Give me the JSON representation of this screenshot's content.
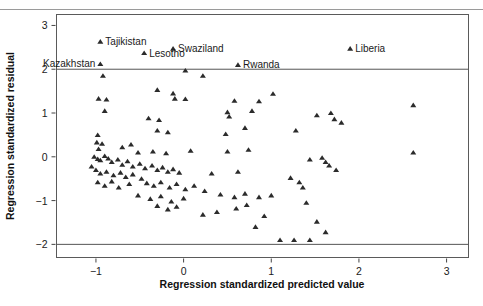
{
  "chart_data": {
    "type": "scatter",
    "title": "",
    "xlabel": "Regression standardized predicted value",
    "ylabel": "Regression standardized residual",
    "xlim": [
      -1.45,
      3.25
    ],
    "ylim": [
      -2.3,
      3.25
    ],
    "xticks": [
      -1,
      0,
      1,
      2,
      3
    ],
    "xticklabels": [
      "−1",
      "0",
      "1",
      "2",
      "3"
    ],
    "yticks": [
      -2,
      -1,
      0,
      1,
      2,
      3
    ],
    "yticklabels": [
      "−2",
      "−1",
      "0",
      "1",
      "2",
      "3"
    ],
    "grid": false,
    "legend": null,
    "reference_lines": [
      {
        "axis": "y",
        "value": 2
      },
      {
        "axis": "y",
        "value": -2
      }
    ],
    "marker": "triangle",
    "marker_color": "#2b2b2b",
    "annotations": [
      {
        "label": "Tajikistan",
        "x": -0.95,
        "y": 2.63,
        "anchor": "left"
      },
      {
        "label": "Kazakhstan",
        "x": -0.95,
        "y": 2.12,
        "anchor": "right"
      },
      {
        "label": "Lesotho",
        "x": -0.45,
        "y": 2.37,
        "anchor": "left"
      },
      {
        "label": "Swaziland",
        "x": -0.12,
        "y": 2.47,
        "anchor": "left"
      },
      {
        "label": "Rwanda",
        "x": 0.62,
        "y": 2.1,
        "anchor": "left"
      },
      {
        "label": "Liberia",
        "x": 1.9,
        "y": 2.47,
        "anchor": "left"
      }
    ],
    "points": [
      [
        -0.95,
        2.63
      ],
      [
        -0.95,
        2.12
      ],
      [
        -0.45,
        2.37
      ],
      [
        -0.12,
        2.47
      ],
      [
        0.62,
        2.1
      ],
      [
        1.9,
        2.47
      ],
      [
        -0.92,
        1.85
      ],
      [
        0.02,
        1.97
      ],
      [
        0.22,
        1.85
      ],
      [
        -0.3,
        1.53
      ],
      [
        -0.12,
        1.45
      ],
      [
        -0.1,
        1.33
      ],
      [
        0.02,
        1.32
      ],
      [
        0.58,
        1.28
      ],
      [
        0.86,
        1.27
      ],
      [
        1.02,
        1.44
      ],
      [
        -0.97,
        1.33
      ],
      [
        -0.88,
        1.31
      ],
      [
        2.62,
        1.18
      ],
      [
        -0.9,
        1.05
      ],
      [
        0.5,
        1.02
      ],
      [
        0.52,
        0.92
      ],
      [
        0.78,
        1.05
      ],
      [
        1.52,
        0.95
      ],
      [
        1.68,
        1.0
      ],
      [
        1.72,
        0.86
      ],
      [
        1.8,
        0.78
      ],
      [
        -0.4,
        0.88
      ],
      [
        -0.28,
        0.84
      ],
      [
        -0.98,
        0.5
      ],
      [
        -0.3,
        0.6
      ],
      [
        -0.18,
        0.56
      ],
      [
        0.48,
        0.52
      ],
      [
        0.7,
        0.66
      ],
      [
        1.28,
        0.6
      ],
      [
        -0.99,
        0.33
      ],
      [
        -0.93,
        0.3
      ],
      [
        -0.97,
        0.18
      ],
      [
        -0.7,
        0.22
      ],
      [
        -0.6,
        0.28
      ],
      [
        -0.52,
        0.1
      ],
      [
        -0.35,
        0.12
      ],
      [
        -0.2,
        0.08
      ],
      [
        0.08,
        0.14
      ],
      [
        0.5,
        0.12
      ],
      [
        0.74,
        0.16
      ],
      [
        2.62,
        0.1
      ],
      [
        -1.02,
        0.0
      ],
      [
        -0.98,
        -0.05
      ],
      [
        -0.95,
        -0.08
      ],
      [
        -0.9,
        0.02
      ],
      [
        -0.86,
        -0.04
      ],
      [
        -0.82,
        -0.12
      ],
      [
        -0.75,
        -0.06
      ],
      [
        -0.7,
        -0.18
      ],
      [
        -0.64,
        -0.1
      ],
      [
        -0.58,
        -0.22
      ],
      [
        -0.5,
        -0.16
      ],
      [
        -0.44,
        -0.26
      ],
      [
        -0.36,
        -0.2
      ],
      [
        -0.3,
        -0.3
      ],
      [
        -0.24,
        -0.24
      ],
      [
        -0.18,
        -0.34
      ],
      [
        -0.12,
        -0.28
      ],
      [
        -0.05,
        -0.36
      ],
      [
        -1.05,
        -0.22
      ],
      [
        -1.0,
        -0.3
      ],
      [
        -0.95,
        -0.38
      ],
      [
        -0.88,
        -0.34
      ],
      [
        -0.8,
        -0.42
      ],
      [
        -0.72,
        -0.36
      ],
      [
        -0.66,
        -0.46
      ],
      [
        -0.58,
        -0.4
      ],
      [
        -0.48,
        -0.5
      ],
      [
        1.44,
        -0.06
      ],
      [
        1.58,
        -0.02
      ],
      [
        1.62,
        -0.12
      ],
      [
        1.66,
        -0.2
      ],
      [
        1.74,
        -0.3
      ],
      [
        0.32,
        -0.38
      ],
      [
        0.62,
        -0.34
      ],
      [
        -0.42,
        -0.6
      ],
      [
        -0.34,
        -0.66
      ],
      [
        -0.26,
        -0.58
      ],
      [
        -0.16,
        -0.7
      ],
      [
        -0.08,
        -0.62
      ],
      [
        0.02,
        -0.74
      ],
      [
        0.12,
        -0.66
      ],
      [
        0.24,
        -0.78
      ],
      [
        -0.98,
        -0.58
      ],
      [
        -0.9,
        -0.66
      ],
      [
        -0.82,
        -0.56
      ],
      [
        -0.74,
        -0.7
      ],
      [
        -0.62,
        -0.62
      ],
      [
        1.22,
        -0.48
      ],
      [
        1.32,
        -0.58
      ],
      [
        1.36,
        -0.7
      ],
      [
        0.42,
        -0.86
      ],
      [
        0.58,
        -0.92
      ],
      [
        0.7,
        -0.84
      ],
      [
        -0.52,
        -0.88
      ],
      [
        -0.38,
        -0.96
      ],
      [
        -0.26,
        -0.9
      ],
      [
        -0.14,
        -1.02
      ],
      [
        0.0,
        -0.95
      ],
      [
        0.86,
        -0.92
      ],
      [
        1.0,
        -0.88
      ],
      [
        1.4,
        -1.05
      ],
      [
        -0.3,
        -1.12
      ],
      [
        -0.18,
        -1.2
      ],
      [
        -0.08,
        -1.14
      ],
      [
        0.6,
        -1.18
      ],
      [
        0.72,
        -1.1
      ],
      [
        0.92,
        -1.35
      ],
      [
        0.22,
        -1.32
      ],
      [
        0.38,
        -1.26
      ],
      [
        1.52,
        -1.48
      ],
      [
        0.82,
        -1.6
      ],
      [
        1.1,
        -1.9
      ],
      [
        1.26,
        -1.9
      ],
      [
        1.44,
        -1.9
      ],
      [
        1.62,
        -1.72
      ]
    ]
  }
}
